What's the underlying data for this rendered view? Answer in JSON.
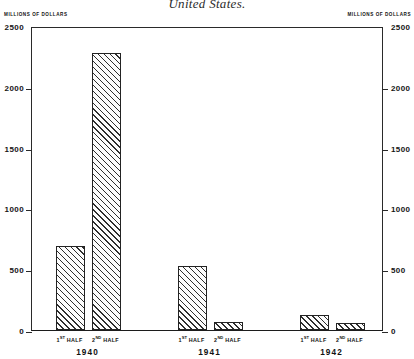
{
  "figure": {
    "title": "United States.",
    "left_axis_caption": "MILLIONS OF DOLLARS",
    "right_axis_caption": "MILLIONS OF DOLLARS"
  },
  "chart_data": {
    "type": "bar",
    "title": "United States.",
    "xlabel": "",
    "ylabel": "MILLIONS OF DOLLARS",
    "ylim": [
      0,
      2500
    ],
    "yticks": [
      0,
      500,
      1000,
      1500,
      2000,
      2500
    ],
    "ytick_labels": [
      "0",
      "500",
      "1000",
      "1500",
      "2000",
      "2500"
    ],
    "grid": false,
    "legend": "none",
    "dual_axis": true,
    "right_ylabel": "MILLIONS OF DOLLARS",
    "groups": [
      "1940",
      "1941",
      "1942"
    ],
    "categories": [
      "1ST HALF 1940",
      "2ND HALF 1940",
      "1ST HALF 1941",
      "2ND HALF 1941",
      "1ST HALF 1942",
      "2ND HALF 1942"
    ],
    "values": [
      690,
      2280,
      530,
      70,
      120,
      60
    ],
    "bars": [
      {
        "group": "1940",
        "half_ordinal": "1",
        "half_suffix": "ST",
        "half_label": "HALF",
        "value": 690
      },
      {
        "group": "1940",
        "half_ordinal": "2",
        "half_suffix": "ND",
        "half_label": "HALF",
        "value": 2280
      },
      {
        "group": "1941",
        "half_ordinal": "1",
        "half_suffix": "ST",
        "half_label": "HALF",
        "value": 530
      },
      {
        "group": "1941",
        "half_ordinal": "2",
        "half_suffix": "ND",
        "half_label": "HALF",
        "value": 70
      },
      {
        "group": "1942",
        "half_ordinal": "1",
        "half_suffix": "ST",
        "half_label": "HALF",
        "value": 120
      },
      {
        "group": "1942",
        "half_ordinal": "2",
        "half_suffix": "ND",
        "half_label": "HALF",
        "value": 60
      }
    ]
  },
  "axis": {
    "ticks": [
      {
        "label": "2500",
        "value": 2500
      },
      {
        "label": "2000",
        "value": 2000
      },
      {
        "label": "1500",
        "value": 1500
      },
      {
        "label": "1000",
        "value": 1000
      },
      {
        "label": "500",
        "value": 500
      },
      {
        "label": "0",
        "value": 0
      }
    ]
  },
  "xaxis": {
    "groups": [
      {
        "year": "1940",
        "halves": [
          {
            "ordinal": "1",
            "suffix": "ST",
            "word": "HALF"
          },
          {
            "ordinal": "2",
            "suffix": "ND",
            "word": "HALF"
          }
        ]
      },
      {
        "year": "1941",
        "halves": [
          {
            "ordinal": "1",
            "suffix": "ST",
            "word": "HALF"
          },
          {
            "ordinal": "2",
            "suffix": "ND",
            "word": "HALF"
          }
        ]
      },
      {
        "year": "1942",
        "halves": [
          {
            "ordinal": "1",
            "suffix": "ST",
            "word": "HALF"
          },
          {
            "ordinal": "2",
            "suffix": "ND",
            "word": "HALF"
          }
        ]
      }
    ]
  }
}
